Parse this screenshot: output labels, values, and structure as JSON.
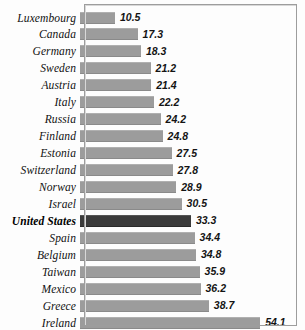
{
  "chart_data": {
    "type": "bar",
    "orientation": "horizontal",
    "title": "",
    "subtitle": "",
    "xlabel": "",
    "ylabel": "",
    "grid": false,
    "legend": null,
    "xlim": [
      0,
      57
    ],
    "highlighted_category": "United States",
    "categories": [
      "Luxembourg",
      "Canada",
      "Germany",
      "Sweden",
      "Austria",
      "Italy",
      "Russia",
      "Finland",
      "Estonia",
      "Switzerland",
      "Norway",
      "Israel",
      "United States",
      "Spain",
      "Belgium",
      "Taiwan",
      "Mexico",
      "Greece",
      "Ireland"
    ],
    "values": [
      10.5,
      17.3,
      18.3,
      21.2,
      21.4,
      22.2,
      24.2,
      24.8,
      27.5,
      27.8,
      28.9,
      30.5,
      33.3,
      34.4,
      34.8,
      35.9,
      36.2,
      38.7,
      54.1
    ],
    "value_labels": [
      "10.5",
      "17.3",
      "18.3",
      "21.2",
      "21.4",
      "22.2",
      "24.2",
      "24.8",
      "27.5",
      "27.8",
      "28.9",
      "30.5",
      "33.3",
      "34.4",
      "34.8",
      "35.9",
      "36.2",
      "38.7",
      "54.1"
    ],
    "colors": {
      "bar": "#9c9c9c",
      "bar_highlight": "#3b3b3b",
      "frame": "#9d9d9d",
      "label_text": "#111111",
      "value_text": "#141414",
      "background": "#fdfdfd"
    }
  }
}
